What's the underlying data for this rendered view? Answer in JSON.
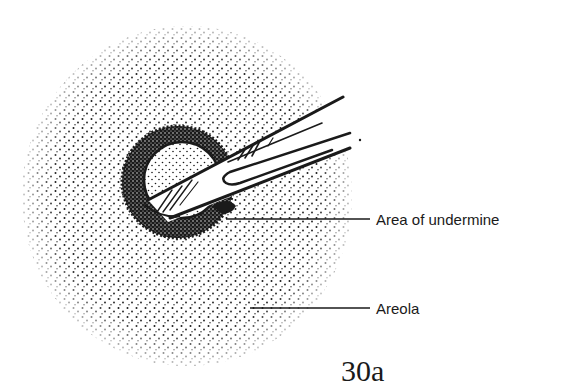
{
  "figure": {
    "number": "30a",
    "labels": [
      {
        "id": "undermine",
        "text": "Area of undermine"
      },
      {
        "id": "areola",
        "text": "Areola"
      }
    ]
  },
  "colors": {
    "ink": "#1a1a1a",
    "background": "#ffffff"
  },
  "icons": {
    "instrument": "probe-forceps-icon"
  }
}
